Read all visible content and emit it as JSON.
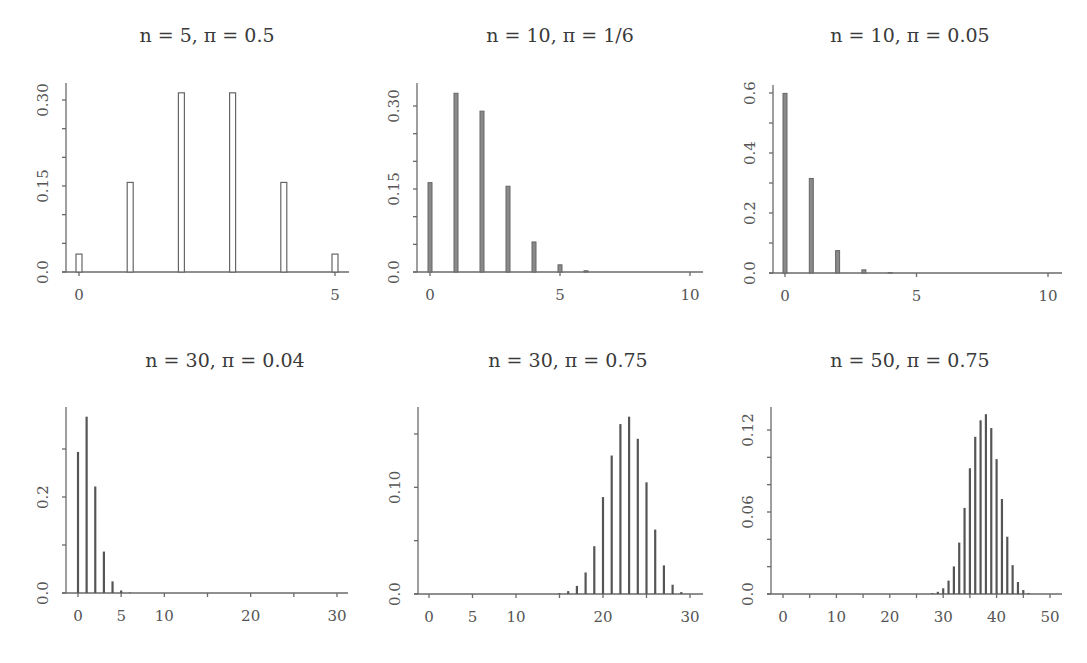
{
  "figure": {
    "type": "small-multiples",
    "rows": 2,
    "cols": 3
  },
  "chart_data": [
    {
      "type": "bar",
      "title": "n = 5, π = 0.5",
      "n": 5,
      "pi": 0.5,
      "xlabel": "",
      "ylabel": "",
      "x": [
        0,
        1,
        2,
        3,
        4,
        5
      ],
      "values": [
        0.03125,
        0.15625,
        0.3125,
        0.3125,
        0.15625,
        0.03125
      ],
      "xlim": [
        -0.3,
        5.3
      ],
      "ylim": [
        0,
        0.33
      ],
      "xticks": [
        0,
        5
      ],
      "xtick_labels": [
        "0",
        "5"
      ],
      "yticks": [
        0.0,
        0.05,
        0.1,
        0.15,
        0.2,
        0.25,
        0.3
      ],
      "ytick_labels": [
        "0.0",
        "",
        "",
        "0.15",
        "",
        "",
        "0.30"
      ],
      "bar_style": "open",
      "grid": false
    },
    {
      "type": "bar",
      "title": "n = 10, π = 1/6",
      "n": 10,
      "pi": 0.1667,
      "xlabel": "",
      "ylabel": "",
      "x": [
        0,
        1,
        2,
        3,
        4,
        5,
        6,
        7,
        8,
        9,
        10
      ],
      "values": [
        0.1615,
        0.323,
        0.2907,
        0.155,
        0.0543,
        0.013,
        0.0022,
        0.0002,
        0.0,
        0.0,
        0.0
      ],
      "xlim": [
        -0.4,
        10.4
      ],
      "ylim": [
        0,
        0.33
      ],
      "xticks": [
        0,
        5,
        10
      ],
      "xtick_labels": [
        "0",
        "5",
        "10"
      ],
      "yticks": [
        0.0,
        0.05,
        0.1,
        0.15,
        0.2,
        0.25,
        0.3
      ],
      "ytick_labels": [
        "0.0",
        "",
        "",
        "0.15",
        "",
        "",
        "0.30"
      ],
      "bar_style": "solid",
      "grid": false
    },
    {
      "type": "bar",
      "title": "n = 10, π = 0.05",
      "n": 10,
      "pi": 0.05,
      "xlabel": "",
      "ylabel": "",
      "x": [
        0,
        1,
        2,
        3,
        4,
        5,
        6,
        7,
        8,
        9,
        10
      ],
      "values": [
        0.5987,
        0.3151,
        0.0746,
        0.0105,
        0.001,
        0.0001,
        0.0,
        0.0,
        0.0,
        0.0,
        0.0
      ],
      "xlim": [
        -0.4,
        10.4
      ],
      "ylim": [
        0,
        0.62
      ],
      "xticks": [
        0,
        5,
        10
      ],
      "xtick_labels": [
        "0",
        "5",
        "10"
      ],
      "yticks": [
        0.0,
        0.1,
        0.2,
        0.3,
        0.4,
        0.5,
        0.6
      ],
      "ytick_labels": [
        "0.0",
        "",
        "0.2",
        "",
        "0.4",
        "",
        "0.6"
      ],
      "bar_style": "solid",
      "grid": false
    },
    {
      "type": "bar",
      "title": "n = 30, π = 0.04",
      "n": 30,
      "pi": 0.04,
      "xlabel": "",
      "ylabel": "",
      "x": [
        0,
        1,
        2,
        3,
        4,
        5,
        6,
        7,
        8,
        9,
        10,
        11,
        12,
        13,
        14,
        15,
        16,
        17,
        18,
        19,
        20,
        21,
        22,
        23,
        24,
        25,
        26,
        27,
        28,
        29,
        30
      ],
      "values": [
        0.2939,
        0.3673,
        0.2219,
        0.0863,
        0.0243,
        0.0053,
        0.0009,
        0.0001,
        0,
        0,
        0,
        0,
        0,
        0,
        0,
        0,
        0,
        0,
        0,
        0,
        0,
        0,
        0,
        0,
        0,
        0,
        0,
        0,
        0,
        0,
        0
      ],
      "xlim": [
        -1.2,
        31.2
      ],
      "ylim": [
        0,
        0.38
      ],
      "xticks": [
        0,
        5,
        10,
        15,
        20,
        25,
        30
      ],
      "xtick_labels": [
        "0",
        "5",
        "10",
        "",
        "20",
        "",
        "30"
      ],
      "yticks": [
        0.0,
        0.1,
        0.2,
        0.3
      ],
      "ytick_labels": [
        "0.0",
        "",
        "0.2",
        ""
      ],
      "bar_style": "line",
      "grid": false
    },
    {
      "type": "bar",
      "title": "n = 30, π = 0.75",
      "n": 30,
      "pi": 0.75,
      "xlabel": "",
      "ylabel": "",
      "x": [
        0,
        1,
        2,
        3,
        4,
        5,
        6,
        7,
        8,
        9,
        10,
        11,
        12,
        13,
        14,
        15,
        16,
        17,
        18,
        19,
        20,
        21,
        22,
        23,
        24,
        25,
        26,
        27,
        28,
        29,
        30
      ],
      "values": [
        0,
        0,
        0,
        0,
        0,
        0,
        0,
        0,
        0,
        0,
        0,
        0,
        0,
        0,
        0.0002,
        0.0008,
        0.0027,
        0.0076,
        0.0202,
        0.0448,
        0.0909,
        0.1298,
        0.1593,
        0.1662,
        0.1455,
        0.1047,
        0.0604,
        0.0268,
        0.0087,
        0.0018,
        0.0002
      ],
      "xlim": [
        -1.2,
        31.2
      ],
      "ylim": [
        0,
        0.175
      ],
      "xticks": [
        0,
        5,
        10,
        15,
        20,
        25,
        30
      ],
      "xtick_labels": [
        "0",
        "5",
        "10",
        "",
        "20",
        "",
        "30"
      ],
      "yticks": [
        0.0,
        0.05,
        0.1,
        0.15
      ],
      "ytick_labels": [
        "0.0",
        "",
        "0.10",
        ""
      ],
      "bar_style": "line",
      "grid": false
    },
    {
      "type": "bar",
      "title": "n = 50, π = 0.75",
      "n": 50,
      "pi": 0.75,
      "xlabel": "",
      "ylabel": "",
      "x": [
        0,
        1,
        2,
        3,
        4,
        5,
        6,
        7,
        8,
        9,
        10,
        11,
        12,
        13,
        14,
        15,
        16,
        17,
        18,
        19,
        20,
        21,
        22,
        23,
        24,
        25,
        26,
        27,
        28,
        29,
        30,
        31,
        32,
        33,
        34,
        35,
        36,
        37,
        38,
        39,
        40,
        41,
        42,
        43,
        44,
        45,
        46,
        47,
        48,
        49,
        50
      ],
      "values": [
        0,
        0,
        0,
        0,
        0,
        0,
        0,
        0,
        0,
        0,
        0,
        0,
        0,
        0,
        0,
        0,
        0,
        0,
        0,
        0,
        0,
        0,
        0,
        0,
        0,
        0,
        0,
        0.0001,
        0.0006,
        0.0016,
        0.0042,
        0.0098,
        0.0202,
        0.0376,
        0.063,
        0.092,
        0.115,
        0.1271,
        0.1316,
        0.1214,
        0.0987,
        0.0695,
        0.0419,
        0.0211,
        0.0088,
        0.0029,
        0.0007,
        0.0001,
        0,
        0,
        0
      ],
      "xlim": [
        -2,
        52
      ],
      "ylim": [
        0,
        0.14
      ],
      "xticks": [
        0,
        5,
        10,
        15,
        20,
        25,
        30,
        35,
        40,
        45,
        50
      ],
      "xtick_labels": [
        "0",
        "",
        "10",
        "",
        "20",
        "",
        "30",
        "",
        "40",
        "",
        "50"
      ],
      "yticks": [
        0.0,
        0.02,
        0.04,
        0.06,
        0.08,
        0.1,
        0.12
      ],
      "ytick_labels": [
        "0.0",
        "",
        "",
        "0.06",
        "",
        "",
        "0.12"
      ],
      "bar_style": "line",
      "grid": false
    }
  ],
  "panels": [
    {
      "title": "n = 5, π = 0.5",
      "axis_x": 66,
      "plot_left": 79,
      "plot_right": 335,
      "axis_right": 349,
      "baseline": 272,
      "top": 83
    },
    {
      "title": "n = 10, π = 1/6",
      "axis_x": 417,
      "plot_left": 430,
      "plot_right": 690,
      "axis_right": 703,
      "baseline": 272,
      "top": 83
    },
    {
      "title": "n = 10, π = 0.05",
      "axis_x": 773,
      "plot_left": 785,
      "plot_right": 1048,
      "axis_right": 1062,
      "baseline": 273,
      "top": 85
    },
    {
      "title": "n = 30, π = 0.04",
      "axis_x": 66,
      "plot_left": 78,
      "plot_right": 337,
      "axis_right": 348,
      "baseline": 593,
      "top": 407
    },
    {
      "title": "n = 30, π = 0.75",
      "axis_x": 418,
      "plot_left": 429,
      "plot_right": 690,
      "axis_right": 703,
      "baseline": 594,
      "top": 407
    },
    {
      "title": "n = 50, π = 0.75",
      "axis_x": 771,
      "plot_left": 783,
      "plot_right": 1050,
      "axis_right": 1062,
      "baseline": 594,
      "top": 407
    }
  ]
}
